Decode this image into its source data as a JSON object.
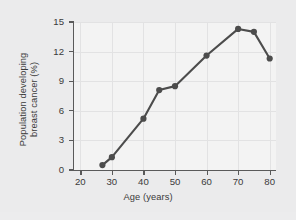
{
  "chart_data": {
    "type": "line",
    "title": "",
    "xlabel": "Age (years)",
    "ylabel_line1": "Population developing",
    "ylabel_line2": "breast cancer (%)",
    "ylabel": "Population developing breast cancer (%)",
    "x": [
      27,
      30,
      40,
      45,
      50,
      60,
      70,
      75,
      80
    ],
    "values": [
      0.5,
      1.3,
      5.2,
      8.1,
      8.5,
      11.6,
      14.3,
      14.0,
      11.3
    ],
    "series": [
      {
        "name": "Population developing breast cancer (%)",
        "values": [
          0.5,
          1.3,
          5.2,
          8.1,
          8.5,
          11.6,
          14.3,
          14.0,
          11.3
        ]
      }
    ],
    "xlim": [
      18,
      82
    ],
    "ylim": [
      0,
      15
    ],
    "xticks": [
      20,
      30,
      40,
      50,
      60,
      70,
      80
    ],
    "yticks": [
      0,
      3,
      6,
      9,
      12,
      15
    ],
    "xtick_labels": [
      "20",
      "30",
      "40",
      "50",
      "60",
      "70",
      "80"
    ],
    "ytick_labels": [
      "0",
      "3",
      "6",
      "9",
      "12",
      "15"
    ],
    "grid": true,
    "legend": false,
    "legend_position": "none",
    "marker": "circle",
    "colors": {
      "line": "#4c4c4c",
      "marker": "#4c4c4c",
      "axis": "#5a5a5a",
      "grid": "#e2e2e3",
      "plot_background": "#f3f3f3",
      "figure_background": "#ebebec",
      "text": "#3a3a3a"
    }
  }
}
